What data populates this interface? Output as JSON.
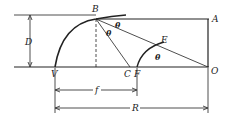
{
  "diagram": {
    "labels": {
      "B": "B",
      "A": "A",
      "E": "E",
      "O": "O",
      "V": "V",
      "C": "C",
      "F": "F",
      "D": "D",
      "f": "f",
      "R": "R",
      "theta1": "θ",
      "theta2": "θ",
      "theta3": "θ"
    },
    "colors": {
      "stroke": "#222222",
      "background": "#ffffff"
    }
  }
}
